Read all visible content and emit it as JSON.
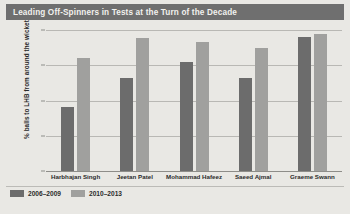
{
  "header": {
    "title": "Leading Off-Spinners in Tests at the Turn of the Decade"
  },
  "colors": {
    "title_bar": "#6f6f6f",
    "title_text": "#f2f1ee",
    "background": "#e9e8e4",
    "series_2006_2009": "#6c6c6c",
    "series_2010_2013": "#a0a09e",
    "gridline": "#b9b8b4",
    "axis": "#8e8d89"
  },
  "legend": {
    "position": "bottom-left",
    "items": [
      {
        "label": "2006–2009",
        "color": "#6c6c6c"
      },
      {
        "label": "2010–2013",
        "color": "#a0a09e"
      }
    ]
  },
  "axes": {
    "y_title": "% balls to LHB from around the wicket",
    "y_ticks": [
      "0%",
      "25%",
      "50%",
      "75%",
      "100%"
    ],
    "x_title": ""
  },
  "chart_data": {
    "type": "bar",
    "title": "Leading Off-Spinners in Tests at the Turn of the Decade",
    "subtitle": "",
    "xlabel": "",
    "ylabel": "% balls to LHB from around the wicket",
    "ylim": [
      0,
      100
    ],
    "yticks": [
      0,
      25,
      50,
      75,
      100
    ],
    "ytick_labels": [
      "0%",
      "25%",
      "50%",
      "75%",
      "100%"
    ],
    "grid": true,
    "legend_position": "bottom-left",
    "categories": [
      "Harbhajan Singh",
      "Jeetan Patel",
      "Mohammad Hafeez",
      "Saeed Ajmal",
      "Graeme Swann"
    ],
    "series": [
      {
        "name": "2006–2009",
        "color": "#6c6c6c",
        "values": [
          46,
          67,
          78,
          67,
          96
        ]
      },
      {
        "name": "2010–2013",
        "color": "#a0a09e",
        "values": [
          81,
          95,
          92,
          88,
          98
        ]
      }
    ]
  }
}
